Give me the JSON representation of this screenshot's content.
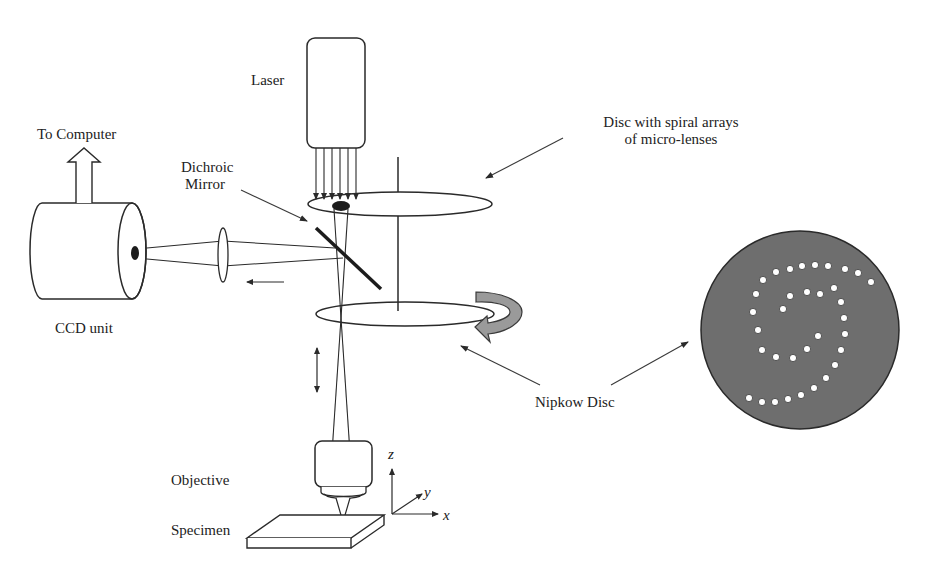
{
  "diagram": {
    "labels": {
      "laser": "Laser",
      "to_computer": "To Computer",
      "dichroic_line1": "Dichroic",
      "dichroic_line2": "Mirror",
      "disc_microlens_line1": "Disc with spiral arrays",
      "disc_microlens_line2": "of micro-lenses",
      "ccd_unit": "CCD unit",
      "nipkow_disc": "Nipkow Disc",
      "objective": "Objective",
      "specimen": "Specimen",
      "axis_x": "x",
      "axis_y": "y",
      "axis_z": "z"
    },
    "colors": {
      "line": "#2a2a2a",
      "disc_fill": "#6e6e6e",
      "pinhole_fill": "#ffffff",
      "rotation_arrow_fill": "#9a9a9a"
    },
    "components": [
      {
        "name": "laser",
        "type": "source"
      },
      {
        "name": "microlens-disc",
        "type": "rotating disc"
      },
      {
        "name": "dichroic-mirror",
        "type": "beam splitter"
      },
      {
        "name": "nipkow-disc",
        "type": "pinhole disc"
      },
      {
        "name": "objective",
        "type": "lens"
      },
      {
        "name": "specimen",
        "type": "sample"
      },
      {
        "name": "relay-lens",
        "type": "lens"
      },
      {
        "name": "ccd-unit",
        "type": "detector"
      }
    ],
    "nipkow_pinholes": [
      [
        749,
        398
      ],
      [
        762,
        402
      ],
      [
        775,
        402
      ],
      [
        788,
        399
      ],
      [
        801,
        395
      ],
      [
        814,
        388
      ],
      [
        826,
        378
      ],
      [
        835,
        365
      ],
      [
        841,
        350
      ],
      [
        845,
        334
      ],
      [
        844,
        318
      ],
      [
        841,
        302
      ],
      [
        834,
        288
      ],
      [
        762,
        350
      ],
      [
        776,
        357
      ],
      [
        793,
        358
      ],
      [
        807,
        349
      ],
      [
        818,
        336
      ],
      [
        758,
        330
      ],
      [
        753,
        312
      ],
      [
        756,
        294
      ],
      [
        763,
        280
      ],
      [
        776,
        272
      ],
      [
        790,
        269
      ],
      [
        802,
        266
      ],
      [
        815,
        265
      ],
      [
        828,
        266
      ],
      [
        845,
        269
      ],
      [
        858,
        273
      ],
      [
        871,
        282
      ],
      [
        790,
        296
      ],
      [
        783,
        309
      ],
      [
        807,
        292
      ],
      [
        820,
        294
      ]
    ]
  }
}
